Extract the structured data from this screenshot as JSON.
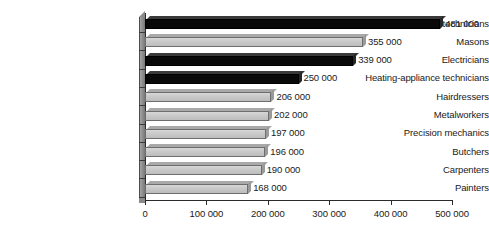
{
  "chart_data": {
    "type": "bar",
    "orientation": "horizontal",
    "title": "",
    "subtitle": "",
    "xlabel": "",
    "ylabel": "",
    "xlim": [
      0,
      500000
    ],
    "grid": false,
    "legend": null,
    "xticks": [
      0,
      100000,
      200000,
      300000,
      400000,
      500000
    ],
    "xtick_labels": [
      "0",
      "100 000",
      "200 000",
      "300 000",
      "400 000",
      "500 000"
    ],
    "categories": [
      "Automotive technicians",
      "Masons",
      "Electricians",
      "Heating-appliance technicians",
      "Hairdressers",
      "Metalworkers",
      "Precision mechanics",
      "Butchers",
      "Carpenters",
      "Painters"
    ],
    "values": [
      481000,
      355000,
      339000,
      250000,
      206000,
      202000,
      197000,
      196000,
      190000,
      168000
    ],
    "value_labels": [
      "481 000",
      "355 000",
      "339 000",
      "250 000",
      "206 000",
      "202 000",
      "197 000",
      "196 000",
      "190 000",
      "168 000"
    ],
    "bar_styles": [
      "dark",
      "light",
      "dark",
      "dark",
      "light",
      "light",
      "light",
      "light",
      "light",
      "light"
    ],
    "colors": {
      "dark_bar": "#090909",
      "light_bar": "#c9c9c9",
      "axis": "#2b2b2b",
      "axis_wall": "#8a8a8a",
      "text": "#1a1a1a",
      "background": "#ffffff"
    }
  }
}
